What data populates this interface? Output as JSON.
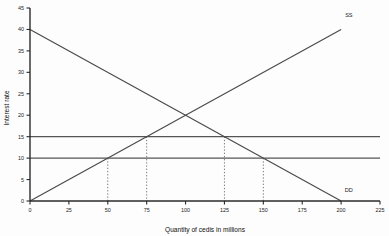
{
  "chart_data": {
    "type": "line",
    "title": "",
    "xlabel": "Quantity of cedis in millions",
    "ylabel": "Interest rate",
    "xlim": [
      0,
      225
    ],
    "ylim": [
      0,
      45
    ],
    "grid": false,
    "legend_position": "inline-end-labels",
    "xticks": [
      0,
      25,
      50,
      75,
      100,
      125,
      150,
      175,
      200,
      225
    ],
    "xticklabels": [
      "0",
      "25",
      "50",
      "75",
      "100",
      "125",
      "150",
      "175",
      "200",
      "225"
    ],
    "yticks": [
      0,
      5,
      10,
      15,
      20,
      25,
      30,
      35,
      40,
      45
    ],
    "yticklabels": [
      "0",
      "5",
      "10",
      "15",
      "20",
      "25",
      "30",
      "35",
      "40",
      "45"
    ],
    "series": [
      {
        "name": "SS",
        "label": "SS",
        "role": "supply",
        "points": [
          [
            0,
            0
          ],
          [
            200,
            40
          ]
        ],
        "label_at": [
          205,
          43
        ]
      },
      {
        "name": "DD",
        "label": "DD",
        "role": "demand",
        "points": [
          [
            0,
            40
          ],
          [
            200,
            0
          ]
        ],
        "label_at": [
          205,
          2
        ]
      },
      {
        "name": "rate-15",
        "label": "",
        "role": "horizontal-rate-line",
        "points": [
          [
            0,
            15
          ],
          [
            225,
            15
          ]
        ],
        "label_at": null
      },
      {
        "name": "rate-10",
        "label": "",
        "role": "horizontal-rate-line",
        "points": [
          [
            0,
            10
          ],
          [
            225,
            10
          ]
        ],
        "label_at": null
      }
    ],
    "equilibrium": {
      "x": 100,
      "y": 20
    },
    "droplines": [
      {
        "x": 50,
        "from_y": 10,
        "to_y": 0
      },
      {
        "x": 75,
        "from_y": 15,
        "to_y": 0
      },
      {
        "x": 125,
        "from_y": 15,
        "to_y": 0
      },
      {
        "x": 150,
        "from_y": 10,
        "to_y": 0
      }
    ],
    "colors": {
      "axis": "#2b2b2b",
      "curve": "#4a4a4a",
      "rate_line": "#555555",
      "dropline": "#666666",
      "background": "#fdfdfd",
      "text": "#1c1c1c"
    }
  }
}
